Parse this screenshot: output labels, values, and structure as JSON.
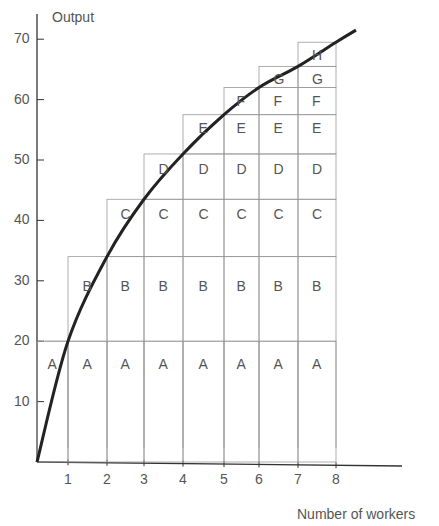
{
  "chart_data": {
    "type": "line",
    "title": "",
    "xlabel": "Number of workers",
    "ylabel": "Output",
    "x_ticks": [
      1,
      2,
      3,
      4,
      5,
      6,
      7,
      8
    ],
    "y_ticks": [
      10,
      20,
      30,
      40,
      50,
      60,
      70
    ],
    "xlim": [
      0,
      10
    ],
    "ylim": [
      0,
      72
    ],
    "grid": false,
    "series": [
      {
        "name": "Total output curve",
        "x": [
          0,
          1,
          2,
          3,
          4,
          5,
          6,
          7,
          8
        ],
        "values": [
          0,
          20,
          34,
          43.5,
          51,
          57.5,
          62,
          65.5,
          69.5
        ]
      }
    ],
    "marginal_blocks": [
      {
        "label": "A",
        "marginal_output": 20,
        "from_worker": 1,
        "bottom": 0,
        "top": 20
      },
      {
        "label": "B",
        "marginal_output": 14,
        "from_worker": 2,
        "bottom": 20,
        "top": 34
      },
      {
        "label": "C",
        "marginal_output": 9.5,
        "from_worker": 3,
        "bottom": 34,
        "top": 43.5
      },
      {
        "label": "D",
        "marginal_output": 7.5,
        "from_worker": 4,
        "bottom": 43.5,
        "top": 51
      },
      {
        "label": "E",
        "marginal_output": 6.5,
        "from_worker": 5,
        "bottom": 51,
        "top": 57.5
      },
      {
        "label": "F",
        "marginal_output": 4.5,
        "from_worker": 6,
        "bottom": 57.5,
        "top": 62
      },
      {
        "label": "G",
        "marginal_output": 3.5,
        "from_worker": 7,
        "bottom": 62,
        "top": 65.5
      },
      {
        "label": "H",
        "marginal_output": 4,
        "from_worker": 8,
        "bottom": 65.5,
        "top": 69.5
      }
    ]
  },
  "axis": {
    "y_title": "Output",
    "x_title": "Number of workers",
    "y_ticks": [
      "70",
      "60",
      "50",
      "40",
      "30",
      "20",
      "10"
    ],
    "x_ticks": [
      "1",
      "2",
      "3",
      "4",
      "5",
      "6",
      "7",
      "8"
    ]
  }
}
